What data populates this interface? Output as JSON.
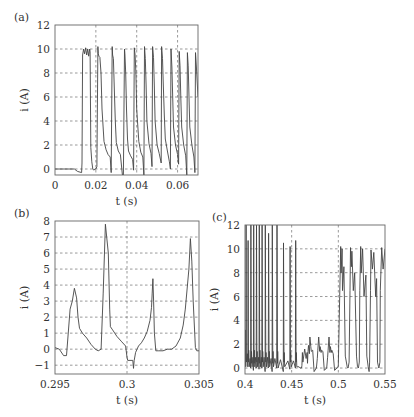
{
  "chart_data": [
    {
      "panel_label": "(a)",
      "type": "line",
      "xlabel": "t (s)",
      "ylabel": "i (A)",
      "xlim": [
        0,
        0.07
      ],
      "ylim": [
        -0.5,
        12
      ],
      "xticks": [
        0,
        0.02,
        0.04,
        0.06
      ],
      "xtick_labels": [
        "0",
        "0.02",
        "0.04",
        "0.06"
      ],
      "yticks": [
        0,
        2,
        4,
        6,
        8,
        10,
        12
      ],
      "ytick_labels": [
        "0",
        "2",
        "4",
        "6",
        "8",
        "10",
        "12"
      ],
      "grid": true,
      "grid_style": "dashed",
      "frame": {
        "x": 55,
        "y": 25,
        "w": 143,
        "h": 150
      },
      "series": [
        {
          "name": "current",
          "x": [
            0,
            0.0095,
            0.011,
            0.013,
            0.0132,
            0.0135,
            0.014,
            0.0145,
            0.015,
            0.0155,
            0.016,
            0.0165,
            0.017,
            0.0172,
            0.0175,
            0.018,
            0.0185,
            0.019,
            0.0195,
            0.02,
            0.0205,
            0.021,
            0.0212,
            0.0215,
            0.022,
            0.0225,
            0.023,
            0.024,
            0.025,
            0.026,
            0.027,
            0.0275,
            0.028,
            0.0282,
            0.0286,
            0.029,
            0.0295,
            0.03,
            0.031,
            0.032,
            0.033,
            0.0335,
            0.034,
            0.0342,
            0.0346,
            0.035,
            0.0355,
            0.036,
            0.037,
            0.038,
            0.0385,
            0.0388,
            0.0392,
            0.0396,
            0.04,
            0.041,
            0.042,
            0.043,
            0.0435,
            0.0438,
            0.0442,
            0.0446,
            0.045,
            0.046,
            0.047,
            0.0475,
            0.0478,
            0.0482,
            0.0486,
            0.049,
            0.05,
            0.051,
            0.052,
            0.0522,
            0.0526,
            0.053,
            0.0535,
            0.054,
            0.055,
            0.056,
            0.0565,
            0.0568,
            0.0572,
            0.0576,
            0.058,
            0.059,
            0.06,
            0.0605,
            0.0608,
            0.0612,
            0.0616,
            0.062,
            0.063,
            0.064,
            0.0645,
            0.0648,
            0.0652,
            0.0656,
            0.066,
            0.067,
            0.068,
            0.0685,
            0.0688,
            0.0692,
            0.07
          ],
          "y": [
            0,
            0,
            -0.2,
            -0.3,
            0.5,
            9.5,
            10,
            9.6,
            10.1,
            9.5,
            10,
            9.4,
            10,
            9.8,
            1.8,
            0.6,
            0,
            -0.1,
            0,
            0,
            0.2,
            10.2,
            9.6,
            9.4,
            9.3,
            8,
            5,
            2.3,
            1.6,
            1.2,
            1.0,
            -0.3,
            10.2,
            9.5,
            9.2,
            7,
            4,
            2.2,
            1.5,
            1.2,
            -0.5,
            -0.5,
            10,
            9.6,
            8,
            5,
            2.5,
            1.5,
            1.1,
            0.8,
            -0.1,
            10.1,
            9.5,
            8,
            5,
            2.3,
            1.4,
            1.0,
            -0.5,
            10.2,
            9.2,
            7,
            4,
            2.1,
            1.3,
            0.2,
            10.2,
            9.3,
            7,
            4,
            2.0,
            1.3,
            0.5,
            10.2,
            9.2,
            7,
            4.5,
            2.5,
            1.5,
            0.6,
            0,
            10,
            8.5,
            6,
            3.5,
            2,
            1.2,
            0.4,
            9.8,
            8.6,
            6,
            3.5,
            2,
            1.1,
            -0.5,
            9.7,
            8.6,
            6,
            3.5,
            2,
            1,
            -0.3,
            9.7,
            8.5,
            6,
            2
          ]
        }
      ]
    },
    {
      "panel_label": "(b)",
      "type": "line",
      "xlabel": "t (s)",
      "ylabel": "i (A)",
      "xlim": [
        0.295,
        0.305
      ],
      "ylim": [
        -1.55,
        8
      ],
      "xticks": [
        0.295,
        0.3,
        0.305
      ],
      "xtick_labels": [
        "0.295",
        "0.3",
        "0.305"
      ],
      "yticks": [
        -1,
        0,
        1,
        2,
        3,
        4,
        5,
        6,
        7,
        8
      ],
      "ytick_labels": [
        "−1",
        "0",
        "1",
        "2",
        "3",
        "4",
        "5",
        "6",
        "7",
        "8"
      ],
      "grid": true,
      "grid_style": "dashed",
      "frame": {
        "x": 55,
        "y": 221,
        "w": 144,
        "h": 153
      },
      "series": [
        {
          "name": "current",
          "x": [
            0.295,
            0.2953,
            0.2956,
            0.2958,
            0.29605,
            0.2962,
            0.29635,
            0.2965,
            0.2966,
            0.2967,
            0.2969,
            0.2972,
            0.2975,
            0.2978,
            0.298,
            0.2982,
            0.29835,
            0.2985,
            0.2987,
            0.2988,
            0.29885,
            0.299,
            0.2993,
            0.2996,
            0.2999,
            0.3,
            0.30005,
            0.3004,
            0.30045,
            0.3005,
            0.3006,
            0.3008,
            0.301,
            0.3012,
            0.3014,
            0.3016,
            0.3017,
            0.30175,
            0.3018,
            0.30185,
            0.3019,
            0.302,
            0.3022,
            0.3025,
            0.3028,
            0.3031,
            0.3034,
            0.3037,
            0.3039,
            0.30405,
            0.3043,
            0.3044,
            0.3045,
            0.3046,
            0.30475,
            0.30485,
            0.305
          ],
          "y": [
            0.1,
            0,
            -0.4,
            -0.4,
            2.5,
            3.0,
            3.8,
            3.2,
            2.0,
            1.3,
            1.0,
            0.7,
            0.3,
            0.0,
            -0.1,
            0.0,
            3.5,
            7.8,
            6.0,
            2.5,
            1.4,
            1.2,
            0.8,
            0.5,
            0.2,
            -0.5,
            -0.7,
            -0.7,
            -1.2,
            -0.7,
            -0.2,
            0.2,
            0.4,
            0.7,
            1.1,
            1.8,
            2.6,
            3.5,
            4.4,
            3.0,
            1.0,
            -0.1,
            -0.1,
            -0.1,
            0.0,
            0.0,
            0.2,
            0.7,
            1.5,
            2.5,
            5.0,
            6.9,
            5.5,
            3.0,
            0.1,
            -0.1,
            -0.1
          ]
        }
      ]
    },
    {
      "panel_label": "(c)",
      "type": "line",
      "xlabel": "t (s)",
      "ylabel": "i (A)",
      "xlim": [
        0.4,
        0.55
      ],
      "ylim": [
        -0.5,
        12
      ],
      "xticks": [
        0.4,
        0.45,
        0.5,
        0.55
      ],
      "xtick_labels": [
        "0.4",
        "0.45",
        "0.5",
        "0.55"
      ],
      "yticks": [
        0,
        2,
        4,
        6,
        8,
        10,
        12
      ],
      "ytick_labels": [
        "0",
        "2",
        "4",
        "6",
        "8",
        "10",
        "12"
      ],
      "grid": true,
      "grid_style": "dashed",
      "frame": {
        "x": 245,
        "y": 225,
        "w": 140,
        "h": 149
      },
      "segments": [
        {
          "t_start": 0.4,
          "t_end": 0.455,
          "description": "large spikes reaching/exceeding 12 A, later peaks ~10.5 A",
          "spike_times": [
            0.4005,
            0.403,
            0.406,
            0.409,
            0.412,
            0.415,
            0.418,
            0.4215,
            0.425,
            0.429,
            0.434,
            0.441,
            0.448,
            0.454
          ],
          "spike_peaks": [
            3.2,
            10.7,
            12,
            12,
            12,
            12,
            12,
            12,
            11.3,
            12,
            12,
            10.5,
            10.2,
            10.7
          ]
        },
        {
          "t_start": 0.455,
          "t_end": 0.5,
          "description": "low current pulses ~1.5-2.5 A with ripple",
          "pulse_times": [
            0.461,
            0.469,
            0.48,
            0.491
          ],
          "pulse_peaks": [
            1.6,
            2.6,
            2.6,
            2.6
          ]
        },
        {
          "t_start": 0.5,
          "t_end": 0.55,
          "description": "pulses ~10 A with ripple between 6 and 10 A",
          "pulse_times": [
            0.5025,
            0.5125,
            0.5225,
            0.533,
            0.543
          ],
          "pulse_peaks": [
            10.2,
            10.1,
            10.2,
            9.9,
            10.1
          ]
        }
      ],
      "series": [
        {
          "name": "current",
          "x": [
            0.4,
            0.4003,
            0.4005,
            0.4008,
            0.401,
            0.4012,
            0.4015,
            0.4025,
            0.403,
            0.4033,
            0.4038,
            0.404,
            0.4045,
            0.4055,
            0.406,
            0.4063,
            0.4068,
            0.407,
            0.4075,
            0.4085,
            0.409,
            0.4093,
            0.4098,
            0.41,
            0.4105,
            0.4115,
            0.412,
            0.4123,
            0.4128,
            0.413,
            0.4135,
            0.4145,
            0.415,
            0.4153,
            0.4158,
            0.416,
            0.4165,
            0.4175,
            0.418,
            0.4183,
            0.4188,
            0.419,
            0.4195,
            0.4205,
            0.4215,
            0.4218,
            0.4223,
            0.4225,
            0.423,
            0.424,
            0.425,
            0.4253,
            0.4258,
            0.426,
            0.4265,
            0.428,
            0.429,
            0.4293,
            0.4298,
            0.43,
            0.4305,
            0.432,
            0.434,
            0.4343,
            0.4348,
            0.435,
            0.4355,
            0.438,
            0.441,
            0.4413,
            0.4418,
            0.442,
            0.4425,
            0.446,
            0.448,
            0.4483,
            0.4488,
            0.449,
            0.4495,
            0.452,
            0.454,
            0.4543,
            0.4548,
            0.455,
            0.4555,
            0.458,
            0.459,
            0.4605,
            0.461,
            0.4615,
            0.462,
            0.464,
            0.4655,
            0.4665,
            0.467,
            0.4675,
            0.468,
            0.469,
            0.4695,
            0.4705,
            0.471,
            0.4725,
            0.474,
            0.4765,
            0.4775,
            0.478,
            0.479,
            0.48,
            0.4805,
            0.4815,
            0.482,
            0.4835,
            0.485,
            0.4875,
            0.4885,
            0.489,
            0.49,
            0.491,
            0.4915,
            0.4925,
            0.493,
            0.4945,
            0.496,
            0.4985,
            0.4995,
            0.5,
            0.5015,
            0.5025,
            0.503,
            0.504,
            0.5045,
            0.506,
            0.5075,
            0.5095,
            0.5105,
            0.5115,
            0.5125,
            0.513,
            0.514,
            0.5145,
            0.516,
            0.5175,
            0.5195,
            0.5205,
            0.5215,
            0.5225,
            0.523,
            0.524,
            0.5245,
            0.526,
            0.5275,
            0.5295,
            0.5305,
            0.532,
            0.533,
            0.5335,
            0.5345,
            0.535,
            0.5365,
            0.538,
            0.54,
            0.541,
            0.542,
            0.543,
            0.5435,
            0.5445,
            0.545,
            0.5465,
            0.548,
            0.55
          ],
          "y": [
            0.2,
            3.2,
            1.0,
            0.1,
            0.2,
            12,
            0.5,
            1.2,
            0.1,
            10.7,
            0.5,
            1.5,
            0.1,
            0.8,
            0.0,
            12,
            0.4,
            1.4,
            0.1,
            0.9,
            -0.2,
            12,
            0.4,
            1.5,
            0.1,
            0.9,
            0.0,
            12,
            0.5,
            1.4,
            0.1,
            0.9,
            -0.1,
            12,
            0.4,
            1.5,
            0.1,
            0.9,
            0.0,
            12,
            0.5,
            1.4,
            0.1,
            0.9,
            -0.3,
            12,
            0.5,
            1.3,
            0.1,
            0.9,
            0.0,
            11.3,
            0.4,
            1.4,
            0.1,
            0.8,
            -0.3,
            12,
            0.4,
            1.4,
            0.1,
            0.8,
            0.0,
            12,
            0.4,
            1.4,
            0.0,
            0.7,
            -0.3,
            10.5,
            0.5,
            1.3,
            0.1,
            0.6,
            -0.1,
            10.2,
            0.5,
            1.3,
            0.1,
            0.6,
            0.0,
            10.7,
            0.5,
            1.3,
            0.1,
            0.1,
            0.0,
            0.0,
            0.2,
            1.3,
            0.5,
            1.6,
            0.8,
            1.3,
            0.4,
            1.4,
            1.9,
            1.2,
            2.6,
            1.8,
            1.4,
            1.5,
            -0.3,
            0.0,
            0.8,
            1.5,
            2.6,
            1.4,
            1.8,
            1.3,
            1.5,
            1.4,
            -0.2,
            0.0,
            0.9,
            1.5,
            2.6,
            1.3,
            1.8,
            1.3,
            1.5,
            1.2,
            -0.2,
            0.0,
            0.1,
            0.2,
            6,
            10.2,
            8,
            10,
            6.5,
            8.5,
            1.0,
            0.1,
            0.0,
            0.5,
            6.5,
            10.1,
            8.5,
            9.8,
            6.5,
            8,
            1.0,
            0.1,
            0.0,
            0.5,
            6.5,
            10.2,
            8,
            10,
            6,
            7.8,
            1.0,
            0.1,
            -0.3,
            0.5,
            6.5,
            9.9,
            8.3,
            9.7,
            6,
            7.5,
            0.5,
            0.1,
            0.0,
            0.5,
            6.5,
            10.1,
            8.3,
            10,
            6,
            8.2,
            0.8,
            0.1
          ]
        }
      ]
    }
  ]
}
